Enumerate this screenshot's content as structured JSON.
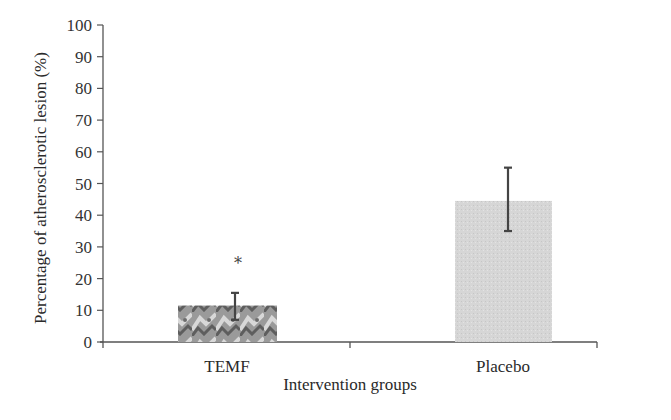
{
  "chart_data": {
    "type": "bar",
    "title": "",
    "xlabel": "Intervention groups",
    "ylabel": "Percentage of atherosclerotic lesion (%)",
    "ylim": [
      0,
      100
    ],
    "yticks": [
      0,
      10,
      20,
      30,
      40,
      50,
      60,
      70,
      80,
      90,
      100
    ],
    "categories": [
      "TEMF",
      "Placebo"
    ],
    "values": [
      11.5,
      44.5
    ],
    "error_bars": [
      {
        "category": "TEMF",
        "lower": 7,
        "upper": 15.5
      },
      {
        "category": "Placebo",
        "lower": 35,
        "upper": 55
      }
    ],
    "annotations": [
      {
        "category": "TEMF",
        "text": "*",
        "y": 25
      }
    ],
    "grid": false,
    "legend": null,
    "colors": {
      "TEMF": "#8a8a8a",
      "Placebo": "#d9d9d9",
      "axis": "#555555",
      "error_bar": "#444444"
    }
  }
}
